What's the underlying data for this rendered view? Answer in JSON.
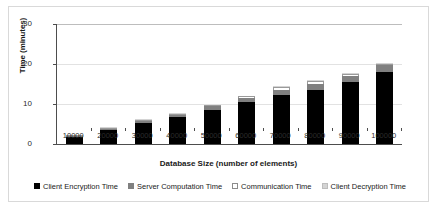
{
  "chart_data": {
    "type": "bar",
    "stacked": true,
    "title": "",
    "xlabel": "Database Size (number of elements)",
    "ylabel": "Time (minutes)",
    "categories": [
      "10000",
      "20000",
      "30000",
      "40000",
      "50000",
      "60000",
      "70000",
      "80000",
      "90000",
      "100000"
    ],
    "ylim": [
      0,
      30
    ],
    "yticks": [
      "0",
      "10",
      "20",
      "30"
    ],
    "ytick_values": [
      0,
      10,
      20,
      30
    ],
    "grid": true,
    "legend_position": "bottom",
    "series": [
      {
        "name": "Client Encryption Time",
        "color": "#000000",
        "values": [
          1.7,
          3.4,
          5.2,
          6.7,
          8.6,
          10.6,
          12.3,
          13.6,
          15.4,
          17.9
        ]
      },
      {
        "name": "Server Computation Time",
        "color": "#808080",
        "values": [
          0.2,
          0.3,
          0.5,
          0.6,
          0.8,
          1.0,
          1.3,
          1.5,
          1.5,
          1.8
        ]
      },
      {
        "name": "Communication Time",
        "color": "#ffffff",
        "values": [
          0.05,
          0.1,
          0.1,
          0.15,
          0.2,
          0.3,
          0.6,
          0.7,
          0.7,
          0.1
        ]
      },
      {
        "name": "Client Decryption Time",
        "color": "#d4d4d4",
        "values": [
          0.05,
          0.05,
          0.1,
          0.1,
          0.1,
          0.1,
          0.1,
          0.1,
          0.1,
          0.1
        ]
      }
    ],
    "totals": [
      2.0,
      3.85,
      5.9,
      7.55,
      9.7,
      12.0,
      14.3,
      15.9,
      17.7,
      19.9
    ]
  },
  "legend": {
    "items": [
      {
        "label": "Client Encryption Time"
      },
      {
        "label": "Server Computation Time"
      },
      {
        "label": "Communication Time"
      },
      {
        "label": "Client Decryption Time"
      }
    ]
  }
}
